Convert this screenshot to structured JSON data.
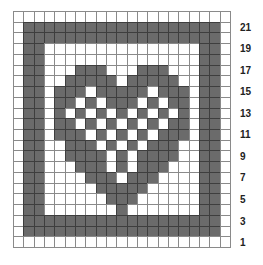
{
  "grid": {
    "columns": 21,
    "rows": 22,
    "filled_color": "#6b6b6b",
    "empty_color": "#ffffff",
    "line_color": "#8a8a8a"
  },
  "row_labels": [
    "21",
    "19",
    "17",
    "15",
    "13",
    "11",
    "9",
    "7",
    "5",
    "3",
    "1"
  ],
  "row_label_rows_from_bottom": [
    21,
    19,
    17,
    15,
    13,
    11,
    9,
    7,
    5,
    3,
    1
  ],
  "filled_cells_by_row_top_down": [
    [],
    [
      2,
      3,
      4,
      5,
      6,
      7,
      8,
      9,
      10,
      11,
      12,
      13,
      14,
      15,
      16,
      17,
      18,
      19,
      20
    ],
    [
      2,
      3,
      4,
      5,
      6,
      7,
      8,
      9,
      10,
      11,
      12,
      13,
      14,
      15,
      16,
      17,
      18,
      19,
      20
    ],
    [
      2,
      3,
      19,
      20
    ],
    [
      2,
      3,
      19,
      20
    ],
    [
      2,
      3,
      7,
      8,
      9,
      13,
      14,
      15,
      19,
      20
    ],
    [
      2,
      3,
      6,
      7,
      8,
      9,
      10,
      12,
      13,
      14,
      15,
      16,
      19,
      20
    ],
    [
      2,
      3,
      5,
      6,
      7,
      9,
      10,
      11,
      12,
      13,
      15,
      16,
      17,
      19,
      20
    ],
    [
      2,
      3,
      5,
      6,
      8,
      10,
      11,
      12,
      14,
      16,
      17,
      19,
      20
    ],
    [
      2,
      3,
      5,
      7,
      9,
      11,
      13,
      15,
      17,
      19,
      20
    ],
    [
      2,
      3,
      5,
      6,
      8,
      10,
      12,
      14,
      16,
      17,
      19,
      20
    ],
    [
      2,
      3,
      5,
      6,
      7,
      9,
      11,
      13,
      15,
      16,
      17,
      19,
      20
    ],
    [
      2,
      3,
      6,
      7,
      8,
      10,
      12,
      14,
      15,
      16,
      19,
      20
    ],
    [
      2,
      3,
      6,
      7,
      8,
      9,
      11,
      13,
      14,
      15,
      16,
      19,
      20
    ],
    [
      2,
      3,
      7,
      8,
      9,
      11,
      13,
      14,
      15,
      19,
      20
    ],
    [
      2,
      3,
      8,
      9,
      10,
      12,
      13,
      14,
      19,
      20
    ],
    [
      2,
      3,
      9,
      10,
      11,
      12,
      13,
      19,
      20
    ],
    [
      2,
      3,
      10,
      11,
      12,
      19,
      20
    ],
    [
      2,
      3,
      11,
      19,
      20
    ],
    [
      2,
      3,
      4,
      5,
      6,
      7,
      8,
      9,
      10,
      11,
      12,
      13,
      14,
      15,
      16,
      17,
      18,
      19,
      20
    ],
    [
      2,
      3,
      4,
      5,
      6,
      7,
      8,
      9,
      10,
      11,
      12,
      13,
      14,
      15,
      16,
      17,
      18,
      19,
      20
    ],
    []
  ],
  "chart_data": {
    "type": "heatmap",
    "title": "",
    "xlabel": "",
    "ylabel": "Row",
    "y_tick_labels": [
      "1",
      "3",
      "5",
      "7",
      "9",
      "11",
      "13",
      "15",
      "17",
      "19",
      "21"
    ],
    "grid": true,
    "legend": "none"
  }
}
